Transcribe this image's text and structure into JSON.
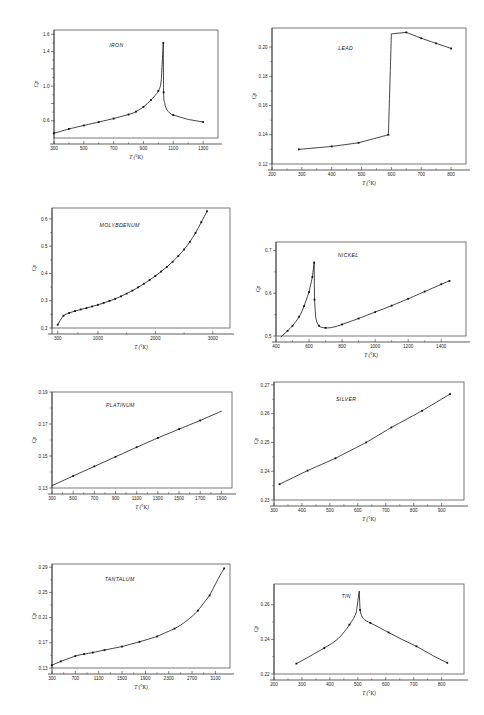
{
  "page": {
    "page_number": "",
    "axis_label_x": "T (°K)",
    "axis_label_y": "Cp"
  },
  "chart_data": [
    {
      "id": "iron",
      "type": "line",
      "title": "IRON",
      "xlabel": "T (°K)",
      "ylabel": "Cp",
      "xlim": [
        300,
        1400
      ],
      "ylim": [
        0.4,
        1.65
      ],
      "xticks": [
        300,
        500,
        700,
        900,
        1100,
        1300
      ],
      "xtick_labels": [
        "300",
        "500",
        "700",
        "900",
        "1100",
        "1300"
      ],
      "yticks": [
        0.6,
        0.8,
        1.0,
        1.2,
        1.4,
        1.6
      ],
      "ytick_labels": [
        "0.6",
        "",
        "1.0",
        "",
        "1.4",
        "1.6"
      ],
      "grid": false,
      "x": [
        300,
        400,
        500,
        600,
        700,
        800,
        850,
        900,
        950,
        1000,
        1020,
        1033,
        1035,
        1043,
        1060,
        1100,
        1200,
        1300
      ],
      "y": [
        0.455,
        0.505,
        0.545,
        0.585,
        0.625,
        0.672,
        0.705,
        0.76,
        0.84,
        0.945,
        1.08,
        1.5,
        0.93,
        0.8,
        0.72,
        0.665,
        0.615,
        0.585
      ],
      "markers_x": [
        300,
        400,
        500,
        600,
        700,
        800,
        850,
        900,
        950,
        1000,
        1033,
        1035,
        1100,
        1300
      ],
      "markers_y": [
        0.455,
        0.505,
        0.545,
        0.585,
        0.625,
        0.672,
        0.705,
        0.76,
        0.84,
        0.945,
        1.5,
        0.93,
        0.665,
        0.585
      ]
    },
    {
      "id": "lead",
      "type": "line",
      "title": "LEAD",
      "xlabel": "T (°K)",
      "ylabel": "Cp",
      "xlim": [
        200,
        850
      ],
      "ylim": [
        0.12,
        0.213
      ],
      "xticks": [
        200,
        300,
        400,
        500,
        600,
        700,
        800
      ],
      "xtick_labels": [
        "200",
        "300",
        "400",
        "500",
        "600",
        "700",
        "800"
      ],
      "yticks": [
        0.12,
        0.14,
        0.16,
        0.18,
        0.2
      ],
      "ytick_labels": [
        "0.12",
        "0.14",
        "0.16",
        "0.18",
        "0.20"
      ],
      "grid": false,
      "x": [
        290,
        400,
        490,
        590,
        600,
        650,
        700,
        750,
        800
      ],
      "y": [
        0.13,
        0.132,
        0.1345,
        0.14,
        0.209,
        0.21,
        0.206,
        0.2025,
        0.199
      ],
      "markers_x": [
        290,
        400,
        490,
        590,
        650,
        700,
        750,
        800
      ],
      "markers_y": [
        0.13,
        0.132,
        0.1345,
        0.14,
        0.21,
        0.206,
        0.2025,
        0.199
      ]
    },
    {
      "id": "molybdenum",
      "type": "line",
      "title": "MOLYBDENUM",
      "xlabel": "T (°K)",
      "ylabel": "Cp",
      "xlim": [
        200,
        3300
      ],
      "ylim": [
        0.2,
        0.64
      ],
      "xticks": [
        300,
        1000,
        2000,
        3000
      ],
      "xtick_labels": [
        "300",
        "1000",
        "2000",
        "3000"
      ],
      "yticks": [
        0.2,
        0.3,
        0.4,
        0.5,
        0.6
      ],
      "ytick_labels": [
        "0.2",
        "0.3",
        "0.4",
        "0.5",
        "0.6"
      ],
      "grid": false,
      "x": [
        300,
        400,
        500,
        600,
        700,
        800,
        900,
        1000,
        1100,
        1200,
        1300,
        1400,
        1500,
        1600,
        1700,
        1800,
        1900,
        2000,
        2100,
        2200,
        2300,
        2400,
        2500,
        2600,
        2700,
        2800,
        2900
      ],
      "y": [
        0.212,
        0.245,
        0.255,
        0.262,
        0.268,
        0.273,
        0.279,
        0.285,
        0.292,
        0.299,
        0.307,
        0.316,
        0.326,
        0.337,
        0.349,
        0.362,
        0.376,
        0.391,
        0.407,
        0.424,
        0.443,
        0.464,
        0.488,
        0.516,
        0.549,
        0.588,
        0.628
      ],
      "markers_x": [
        300,
        400,
        500,
        600,
        700,
        800,
        900,
        1000,
        1100,
        1200,
        1300,
        1400,
        1500,
        1600,
        1700,
        1800,
        1900,
        2000,
        2100,
        2200,
        2300,
        2400,
        2500,
        2600,
        2700,
        2800,
        2900
      ],
      "markers_y": [
        0.212,
        0.245,
        0.255,
        0.262,
        0.268,
        0.273,
        0.279,
        0.285,
        0.292,
        0.299,
        0.307,
        0.316,
        0.326,
        0.337,
        0.349,
        0.362,
        0.376,
        0.391,
        0.407,
        0.424,
        0.443,
        0.464,
        0.488,
        0.516,
        0.549,
        0.588,
        0.628
      ]
    },
    {
      "id": "nickel",
      "type": "line",
      "title": "NICKEL",
      "xlabel": "T (°K)",
      "ylabel": "Cp",
      "xlim": [
        400,
        1550
      ],
      "ylim": [
        0.5,
        0.72
      ],
      "xticks": [
        400,
        600,
        800,
        1000,
        1200,
        1400
      ],
      "xtick_labels": [
        "400",
        "600",
        "800",
        "1000",
        "1200",
        "1400"
      ],
      "yticks": [
        0.5,
        0.6,
        0.7
      ],
      "ytick_labels": [
        "0.5",
        "0.6",
        "0.7"
      ],
      "grid": false,
      "x": [
        430,
        470,
        500,
        540,
        570,
        600,
        620,
        631,
        633,
        640,
        660,
        700,
        750,
        800,
        850,
        900,
        1000,
        1100,
        1200,
        1300,
        1400,
        1450
      ],
      "y": [
        0.498,
        0.512,
        0.524,
        0.545,
        0.57,
        0.603,
        0.638,
        0.672,
        0.585,
        0.545,
        0.524,
        0.519,
        0.521,
        0.527,
        0.534,
        0.541,
        0.556,
        0.571,
        0.587,
        0.604,
        0.621,
        0.629
      ],
      "markers_x": [
        470,
        500,
        540,
        570,
        600,
        620,
        631,
        633,
        660,
        700,
        800,
        900,
        1000,
        1100,
        1200,
        1300,
        1400,
        1450
      ],
      "markers_y": [
        0.512,
        0.524,
        0.545,
        0.57,
        0.603,
        0.638,
        0.672,
        0.585,
        0.524,
        0.519,
        0.527,
        0.541,
        0.556,
        0.571,
        0.587,
        0.604,
        0.621,
        0.629
      ]
    },
    {
      "id": "platinum",
      "type": "line",
      "title": "PLATINUM",
      "xlabel": "T (°K)",
      "ylabel": "Cp",
      "xlim": [
        300,
        2000
      ],
      "ylim": [
        0.13,
        0.19
      ],
      "xticks": [
        300,
        500,
        700,
        900,
        1100,
        1300,
        1500,
        1700,
        1900
      ],
      "xtick_labels": [
        "300",
        "500",
        "700",
        "900",
        "1100",
        "1300",
        "1500",
        "1700",
        "1900"
      ],
      "yticks": [
        0.13,
        0.15,
        0.17,
        0.19
      ],
      "ytick_labels": [
        "0.13",
        "0.15",
        "0.17",
        "0.19"
      ],
      "grid": false,
      "x": [
        300,
        500,
        700,
        900,
        1100,
        1300,
        1500,
        1700,
        1900
      ],
      "y": [
        0.1315,
        0.1375,
        0.1435,
        0.1495,
        0.1555,
        0.1613,
        0.1668,
        0.1722,
        0.178
      ],
      "markers_x": [
        500,
        700,
        900,
        1100,
        1300,
        1500,
        1700
      ],
      "markers_y": [
        0.1375,
        0.1435,
        0.1495,
        0.1555,
        0.1613,
        0.1668,
        0.1722
      ]
    },
    {
      "id": "silver",
      "type": "line",
      "title": "SILVER",
      "xlabel": "T (°K)",
      "ylabel": "Cp",
      "xlim": [
        300,
        980
      ],
      "ylim": [
        0.23,
        0.271
      ],
      "xticks": [
        300,
        400,
        500,
        600,
        700,
        800,
        900
      ],
      "xtick_labels": [
        "300",
        "400",
        "500",
        "600",
        "700",
        "800",
        "900"
      ],
      "yticks": [
        0.23,
        0.24,
        0.25,
        0.26,
        0.27
      ],
      "ytick_labels": [
        "0.23",
        "0.24",
        "0.25",
        "0.26",
        "0.27"
      ],
      "grid": false,
      "x": [
        320,
        420,
        520,
        630,
        720,
        830,
        930
      ],
      "y": [
        0.2355,
        0.2402,
        0.2445,
        0.25,
        0.2552,
        0.261,
        0.2668
      ],
      "markers_x": [
        320,
        420,
        520,
        630,
        720,
        830,
        930
      ],
      "markers_y": [
        0.2355,
        0.2402,
        0.2445,
        0.25,
        0.2552,
        0.261,
        0.2668
      ]
    },
    {
      "id": "tantalum",
      "type": "line",
      "title": "TANTALUM",
      "xlabel": "T (°K)",
      "ylabel": "Cp",
      "xlim": [
        300,
        3350
      ],
      "ylim": [
        0.13,
        0.295
      ],
      "xticks": [
        300,
        700,
        1100,
        1500,
        1900,
        2300,
        2700,
        3100
      ],
      "xtick_labels": [
        "300",
        "700",
        "1100",
        "1500",
        "1900",
        "2300",
        "2700",
        "3100"
      ],
      "yticks": [
        0.13,
        0.17,
        0.21,
        0.25,
        0.29
      ],
      "ytick_labels": [
        "0.13",
        "0.17",
        "0.21",
        "0.25",
        "0.29"
      ],
      "grid": false,
      "x": [
        300,
        450,
        700,
        850,
        1000,
        1200,
        1500,
        1800,
        2100,
        2400,
        2600,
        2800,
        3000,
        3150,
        3250
      ],
      "y": [
        0.1345,
        0.1405,
        0.149,
        0.152,
        0.1545,
        0.1585,
        0.164,
        0.1715,
        0.18,
        0.1925,
        0.2045,
        0.221,
        0.245,
        0.272,
        0.288
      ],
      "markers_x": [
        300,
        450,
        700,
        850,
        1000,
        1200,
        1500,
        1800,
        2100,
        2400,
        2800,
        3000,
        3250
      ],
      "markers_y": [
        0.1345,
        0.1405,
        0.149,
        0.152,
        0.1545,
        0.1585,
        0.164,
        0.1715,
        0.18,
        0.1925,
        0.221,
        0.245,
        0.288
      ]
    },
    {
      "id": "tin",
      "type": "line",
      "title": "TIN",
      "xlabel": "T (°K)",
      "ylabel": "Cp",
      "xlim": [
        200,
        880
      ],
      "ylim": [
        0.22,
        0.272
      ],
      "xticks": [
        200,
        300,
        400,
        500,
        600,
        700,
        800
      ],
      "xtick_labels": [
        "200",
        "300",
        "400",
        "500",
        "600",
        "700",
        "800"
      ],
      "yticks": [
        0.22,
        0.24,
        0.26
      ],
      "ytick_labels": [
        "0.22",
        "0.24",
        "0.26"
      ],
      "grid": false,
      "x": [
        280,
        320,
        380,
        430,
        470,
        495,
        505,
        508,
        520,
        545,
        575,
        610,
        660,
        710,
        770,
        820
      ],
      "y": [
        0.226,
        0.2295,
        0.235,
        0.2405,
        0.2485,
        0.256,
        0.268,
        0.257,
        0.252,
        0.2495,
        0.247,
        0.244,
        0.2398,
        0.236,
        0.2305,
        0.2265
      ],
      "markers_x": [
        280,
        380,
        470,
        508,
        545,
        610,
        710,
        820
      ],
      "markers_y": [
        0.226,
        0.235,
        0.2485,
        0.257,
        0.2495,
        0.244,
        0.236,
        0.2265
      ]
    }
  ],
  "panels": [
    {
      "id": "iron",
      "left": 28,
      "top": 24,
      "width": 196,
      "height": 140
    },
    {
      "id": "lead",
      "left": 246,
      "top": 22,
      "width": 226,
      "height": 168
    },
    {
      "id": "molybdenum",
      "left": 26,
      "top": 202,
      "width": 210,
      "height": 152
    },
    {
      "id": "nickel",
      "left": 250,
      "top": 236,
      "width": 222,
      "height": 126
    },
    {
      "id": "platinum",
      "left": 26,
      "top": 386,
      "width": 212,
      "height": 128
    },
    {
      "id": "silver",
      "left": 248,
      "top": 376,
      "width": 222,
      "height": 150
    },
    {
      "id": "tantalum",
      "left": 26,
      "top": 558,
      "width": 210,
      "height": 136
    },
    {
      "id": "tin",
      "left": 248,
      "top": 578,
      "width": 222,
      "height": 122
    }
  ]
}
